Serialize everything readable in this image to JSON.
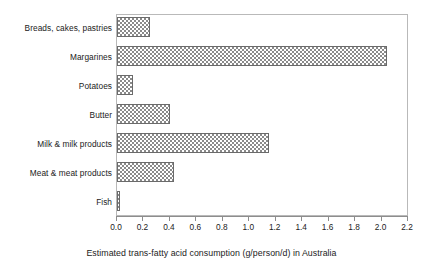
{
  "chart_data": {
    "type": "bar",
    "orientation": "horizontal",
    "title": "",
    "xlabel": "Estimated trans-fatty acid consumption (g/person/d) in Australia",
    "ylabel": "",
    "categories": [
      "Breads, cakes, pastries",
      "Margarines",
      "Potatoes",
      "Butter",
      "Milk & milk products",
      "Meat & meat products",
      "Fish"
    ],
    "values": [
      0.25,
      2.04,
      0.12,
      0.4,
      1.15,
      0.43,
      0.02
    ],
    "xlim": [
      0.0,
      2.2
    ],
    "xticks": [
      0.0,
      0.2,
      0.4,
      0.6,
      0.8,
      1.0,
      1.2,
      1.4,
      1.6,
      1.8,
      2.0,
      2.2
    ],
    "xtick_labels": [
      "0.0",
      "0.2",
      "0.4",
      "0.6",
      "0.8",
      "1.0",
      "1.2",
      "1.4",
      "1.6",
      "1.8",
      "2.0",
      "2.2"
    ],
    "grid": false,
    "legend": null,
    "bar_fill": "checkerboard-hatch",
    "bar_edge_color": "#6b6b6b",
    "bar_pattern_color": "#8a8a8a",
    "frame_color": "#b9b9b9",
    "axis_color": "#8d8d8d",
    "text_color": "#1b1b1b",
    "background": "#ffffff"
  }
}
